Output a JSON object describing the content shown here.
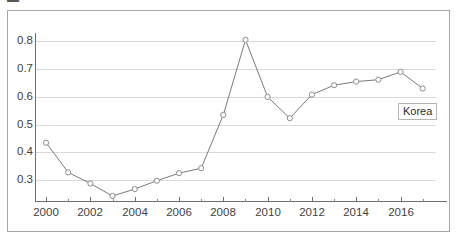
{
  "page": {
    "title_fragment_left": "▬",
    "title_fragment_right": "— — —  — —"
  },
  "chart_data": {
    "type": "line",
    "title": "",
    "xlabel": "",
    "ylabel": "",
    "legend_position": "inline-end-of-line",
    "grid": true,
    "xlim": [
      1999.5,
      2017.6
    ],
    "ylim": [
      0.225,
      0.83
    ],
    "y_ticks": [
      0.8,
      0.7,
      0.6,
      0.5,
      0.4,
      0.3
    ],
    "y_tick_labels": [
      "0.8",
      "0.7",
      "0.6",
      "0.5",
      "0.4",
      "0.3"
    ],
    "x_major_ticks": [
      2000,
      2002,
      2004,
      2006,
      2008,
      2010,
      2012,
      2014,
      2016
    ],
    "x_major_tick_labels": [
      "2000",
      "2002",
      "2004",
      "2006",
      "2008",
      "2010",
      "2012",
      "2014",
      "2016"
    ],
    "x_minor_ticks": [
      2001,
      2003,
      2005,
      2007,
      2009,
      2011,
      2013,
      2015,
      2017
    ],
    "x": [
      2000,
      2001,
      2002,
      2003,
      2004,
      2005,
      2006,
      2007,
      2008,
      2009,
      2010,
      2011,
      2012,
      2013,
      2014,
      2015,
      2016,
      2017
    ],
    "series": [
      {
        "name": "Korea",
        "label": "Korea",
        "color": "#7a7a7a",
        "marker": "open-circle",
        "values": [
          0.435,
          0.328,
          0.288,
          0.243,
          0.268,
          0.298,
          0.325,
          0.343,
          0.535,
          0.805,
          0.6,
          0.523,
          0.608,
          0.642,
          0.655,
          0.662,
          0.69,
          0.63
        ]
      }
    ]
  },
  "colors": {
    "line": "#7a7a7a",
    "marker_stroke": "#8c8c8c",
    "marker_fill": "#ffffff",
    "grid": "#d9d9d9",
    "axis": "#6e6e6e",
    "frame": "#a6a6a6",
    "text": "#3f3f3f"
  }
}
